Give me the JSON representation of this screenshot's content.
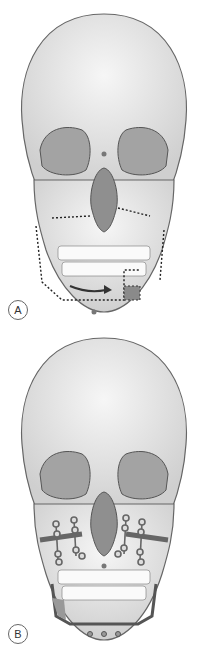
{
  "figure": {
    "panels": [
      {
        "label": "A",
        "description": "Skull frontal view with dotted osteotomy lines on maxilla and mandible, arrow indicating mandibular advancement, shaded bone segment"
      },
      {
        "label": "B",
        "description": "Skull frontal view with miniplate fixation on maxilla and mandibular plate with screws"
      }
    ]
  },
  "colors": {
    "bone": "#e8e8e8",
    "outline": "#555555",
    "orbit": "#9a9a9a",
    "shade": "#888888",
    "dots": "#333333"
  }
}
